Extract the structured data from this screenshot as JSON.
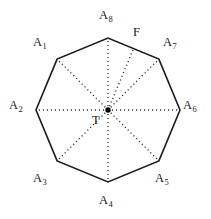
{
  "figure": {
    "background_color": "#ffffff",
    "outline_color": "#1a1a1a",
    "spoke_color": "#2b2b2b",
    "center_dot_color": "#000000",
    "shape": "regular-octagon",
    "vertex_count": 8,
    "center": {
      "x": 108,
      "y": 110,
      "label": "T"
    },
    "circumradius": 72,
    "outline_style": "solid",
    "spoke_style": "dotted",
    "vertices": [
      {
        "id": "A1",
        "base": "A",
        "sub": "1",
        "angle_deg": 135,
        "x": 57.1,
        "y": 59.1,
        "label_x": 33,
        "label_y": 36
      },
      {
        "id": "A2",
        "base": "A",
        "sub": "2",
        "angle_deg": 180,
        "x": 36.0,
        "y": 110.0,
        "label_x": 9,
        "label_y": 99
      },
      {
        "id": "A3",
        "base": "A",
        "sub": "3",
        "angle_deg": 225,
        "x": 57.1,
        "y": 160.9,
        "label_x": 33,
        "label_y": 172
      },
      {
        "id": "A4",
        "base": "A",
        "sub": "4",
        "angle_deg": 270,
        "x": 108.0,
        "y": 182.0,
        "label_x": 99,
        "label_y": 194
      },
      {
        "id": "A5",
        "base": "A",
        "sub": "5",
        "angle_deg": 315,
        "x": 158.9,
        "y": 160.9,
        "label_x": 155,
        "label_y": 172
      },
      {
        "id": "A6",
        "base": "A",
        "sub": "6",
        "angle_deg": 0,
        "x": 180.0,
        "y": 110.0,
        "label_x": 183,
        "label_y": 99
      },
      {
        "id": "A7",
        "base": "A",
        "sub": "7",
        "angle_deg": 45,
        "x": 158.9,
        "y": 59.1,
        "label_x": 163,
        "label_y": 36
      },
      {
        "id": "A8",
        "base": "A",
        "sub": "8",
        "angle_deg": 90,
        "x": 108.0,
        "y": 38.0,
        "label_x": 99,
        "label_y": 9
      }
    ],
    "edge_point": {
      "id": "F",
      "label": "F",
      "on_edge": "A8-A7",
      "x": 133.5,
      "y": 48.6,
      "label_x": 133,
      "label_y": 26
    },
    "center_label": {
      "text": "T",
      "label_x": 92,
      "label_y": 114
    },
    "spokes": [
      {
        "to": "A1"
      },
      {
        "to": "A2"
      },
      {
        "to": "A3"
      },
      {
        "to": "A4"
      },
      {
        "to": "A5"
      },
      {
        "to": "A6"
      },
      {
        "to": "A7"
      },
      {
        "to": "A8"
      },
      {
        "to": "F"
      }
    ]
  }
}
